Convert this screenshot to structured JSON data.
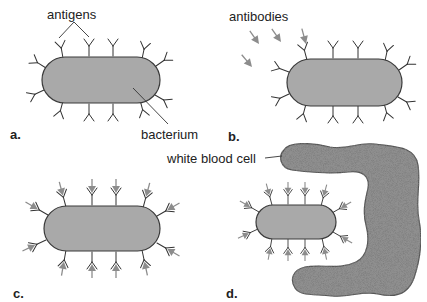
{
  "figure": {
    "colors": {
      "bacterium_fill": "#a9a9a9",
      "outline": "#3a3a3a",
      "antibody": "#8c8c8c",
      "white_blood_cell": "#8f8f8f"
    },
    "labels": {
      "antigens": "antigens",
      "bacterium": "bacterium",
      "antibodies": "antibodies",
      "white_blood_cell": "white blood cell"
    },
    "panels": [
      {
        "id": "a",
        "label": "a.",
        "description": "bacterium with surface antigens"
      },
      {
        "id": "b",
        "label": "b.",
        "description": "free antibodies approaching bacterium"
      },
      {
        "id": "c",
        "label": "c.",
        "description": "antibodies bound to antigens"
      },
      {
        "id": "d",
        "label": "d.",
        "description": "white blood cell engulfing antibody-coated bacterium"
      }
    ]
  }
}
